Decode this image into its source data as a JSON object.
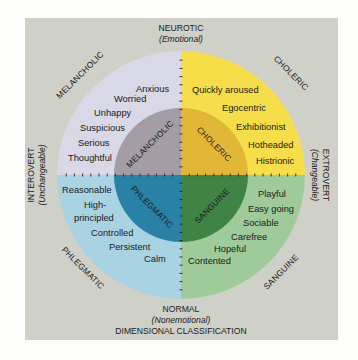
{
  "title": "DIMENSIONAL CLASSIFICATION",
  "axes": {
    "top": {
      "label": "NEUROTIC",
      "sub": "(Emotional)"
    },
    "bottom": {
      "label": "NORMAL",
      "sub": "(Nonemotional)"
    },
    "left": {
      "label": "INTEROVERT",
      "sub": "(Unchangeable)"
    },
    "right": {
      "label": "EXTROVERT",
      "sub": "(Changeable)"
    }
  },
  "colors": {
    "background": "#cfd0c8",
    "melancholic_outer": "#d8d8e6",
    "melancholic_inner": "#a59da6",
    "choleric_outer": "#f5de4a",
    "choleric_inner": "#e2b637",
    "phlegmatic_outer": "#a9d3e3",
    "phlegmatic_inner": "#2a81a6",
    "sanguine_outer": "#9fcb9b",
    "sanguine_inner": "#3f8445"
  },
  "quadrants": {
    "melancholic": {
      "outer_label": "MELANCHOLIC",
      "inner_label": "MELANCHOLIC",
      "traits": [
        "Anxious",
        "Worried",
        "Unhappy",
        "Suspicious",
        "Serious",
        "Thoughtful"
      ]
    },
    "choleric": {
      "outer_label": "CHOLERIC",
      "inner_label": "CHOLERIC",
      "traits": [
        "Quickly aroused",
        "Egocentric",
        "Exhibitionist",
        "Hotheaded",
        "Histrionic"
      ]
    },
    "phlegmatic": {
      "outer_label": "PHLEGMATIC",
      "inner_label": "PHLEGMATIC",
      "traits": [
        "Reasonable",
        "High-",
        "principled",
        "Controlled",
        "Persistent",
        "Calm"
      ]
    },
    "sanguine": {
      "outer_label": "SANGUINE",
      "inner_label": "SANGUINE",
      "traits": [
        "Playful",
        "Easy going",
        "Sociable",
        "Carefree",
        "Hopeful",
        "Contented"
      ]
    }
  }
}
